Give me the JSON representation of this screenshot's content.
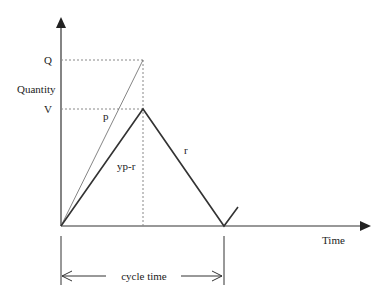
{
  "diagram": {
    "type": "inventory-cycle",
    "labels": {
      "y_axis": "Quantity",
      "x_axis": "Time",
      "q_tick": "Q",
      "v_tick": "V",
      "production_rate": "p",
      "net_rate": "yp-r",
      "demand_rate": "r",
      "cycle": "cycle time"
    },
    "colors": {
      "axis": "#333333",
      "thick_line": "#333333",
      "thin_line": "#777777",
      "dotted": "#888888"
    }
  }
}
